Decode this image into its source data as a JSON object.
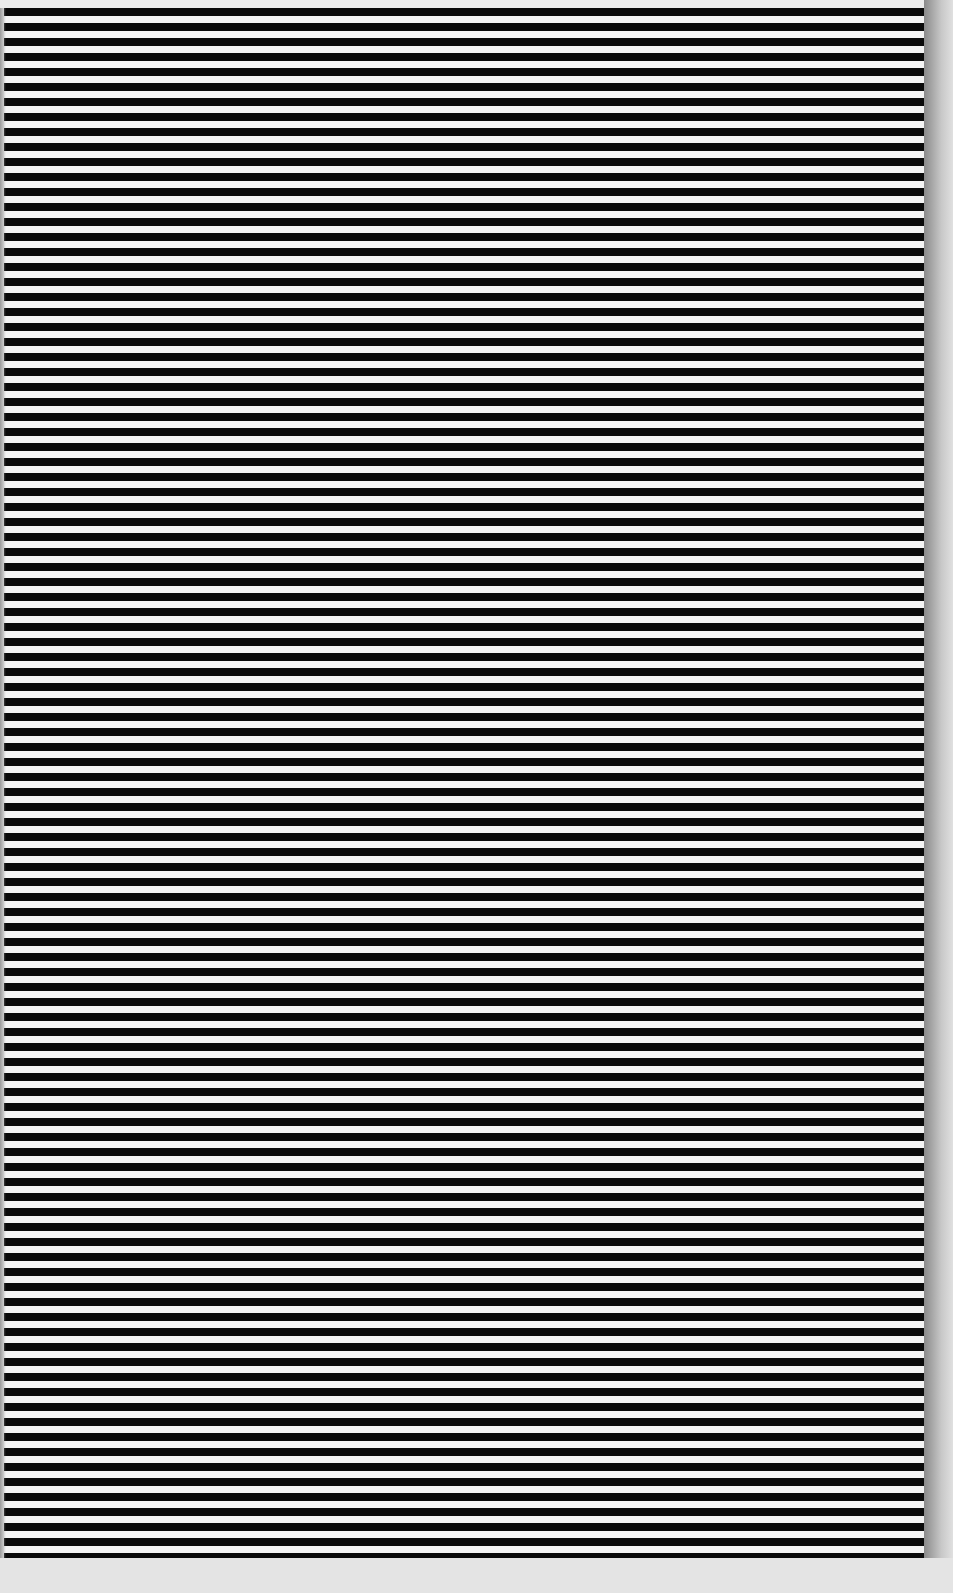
{
  "pattern": {
    "type": "horizontal-stripes",
    "stripe_color": "#0a0a0a",
    "background_color": "#f4f4f4",
    "period_px": 15,
    "dark_band_px": 8,
    "light_band_px": 7
  }
}
